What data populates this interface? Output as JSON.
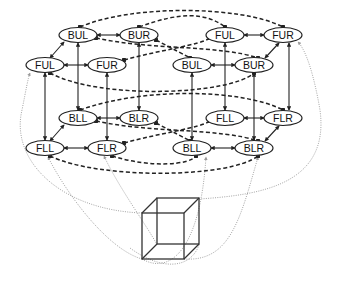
{
  "diagram": {
    "title": "",
    "left_cube": {
      "nodes": [
        {
          "id": "L_BUL",
          "label": "BUL",
          "x": 78,
          "y": 35
        },
        {
          "id": "L_BUR",
          "label": "BUR",
          "x": 139,
          "y": 35
        },
        {
          "id": "L_FUL",
          "label": "FUL",
          "x": 45,
          "y": 65
        },
        {
          "id": "L_FUR",
          "label": "FUR",
          "x": 107,
          "y": 65
        },
        {
          "id": "L_BLL",
          "label": "BLL",
          "x": 78,
          "y": 118
        },
        {
          "id": "L_BLR",
          "label": "BLR",
          "x": 139,
          "y": 118
        },
        {
          "id": "L_FLL",
          "label": "FLL",
          "x": 45,
          "y": 148
        },
        {
          "id": "L_FLR",
          "label": "FLR",
          "x": 107,
          "y": 148
        }
      ]
    },
    "right_cube": {
      "nodes": [
        {
          "id": "R_FUL",
          "label": "FUL",
          "x": 225,
          "y": 35
        },
        {
          "id": "R_FUR",
          "label": "FUR",
          "x": 283,
          "y": 35
        },
        {
          "id": "R_BUL",
          "label": "BUL",
          "x": 192,
          "y": 65
        },
        {
          "id": "R_BUR",
          "label": "BUR",
          "x": 254,
          "y": 65
        },
        {
          "id": "R_FLL",
          "label": "FLL",
          "x": 225,
          "y": 118
        },
        {
          "id": "R_FLR",
          "label": "FLR",
          "x": 283,
          "y": 118
        },
        {
          "id": "R_BLL",
          "label": "BLL",
          "x": 192,
          "y": 148
        },
        {
          "id": "R_BLR",
          "label": "BLR",
          "x": 254,
          "y": 148
        }
      ]
    },
    "edge_styles": {
      "solid": "cube edge within an interpretation",
      "dashed": "inhibitory link between interpretations",
      "dotted": "link from drawing vertex to node"
    },
    "colors": {
      "line": "#222222",
      "dotted": "#9a9a9a",
      "background": "#ffffff"
    },
    "necker_cube": {
      "front": {
        "x": 142,
        "y": 213,
        "w": 42,
        "h": 46
      },
      "back_offset": {
        "dx": 15,
        "dy": -15
      }
    }
  }
}
